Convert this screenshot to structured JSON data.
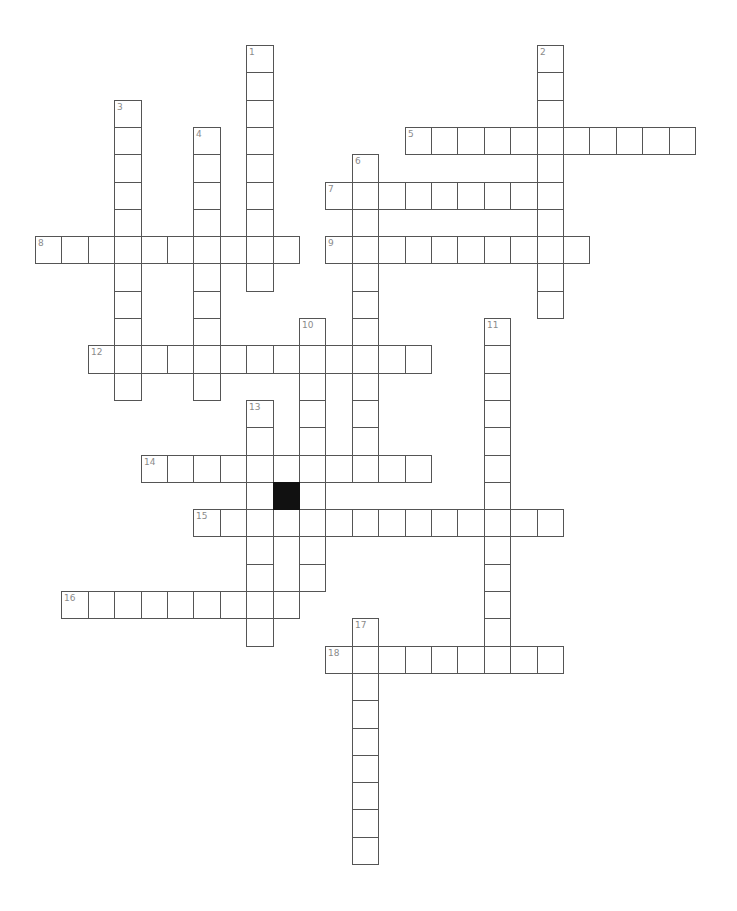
{
  "puzzle": {
    "type": "crossword",
    "grid": {
      "origin_x": 35,
      "origin_y": 45,
      "cell_width": 26.4,
      "cell_height": 27.3,
      "line_color": "#555555",
      "number_color": "#8a8a8a",
      "black_color": "#111111"
    },
    "across": [
      {
        "number": "5",
        "row": 3,
        "col": 14,
        "length": 11
      },
      {
        "number": "7",
        "row": 5,
        "col": 11,
        "length": 9
      },
      {
        "number": "8",
        "row": 7,
        "col": 0,
        "length": 10
      },
      {
        "number": "9",
        "row": 7,
        "col": 11,
        "length": 10
      },
      {
        "number": "12",
        "row": 11,
        "col": 2,
        "length": 13
      },
      {
        "number": "14",
        "row": 15,
        "col": 4,
        "length": 11
      },
      {
        "number": "15",
        "row": 17,
        "col": 6,
        "length": 14
      },
      {
        "number": "16",
        "row": 20,
        "col": 1,
        "length": 9
      },
      {
        "number": "18",
        "row": 22,
        "col": 11,
        "length": 9
      }
    ],
    "down": [
      {
        "number": "1",
        "row": 0,
        "col": 8,
        "length": 9
      },
      {
        "number": "2",
        "row": 0,
        "col": 19,
        "length": 10
      },
      {
        "number": "3",
        "row": 2,
        "col": 3,
        "length": 11
      },
      {
        "number": "4",
        "row": 3,
        "col": 6,
        "length": 10
      },
      {
        "number": "6",
        "row": 4,
        "col": 12,
        "length": 12
      },
      {
        "number": "10",
        "row": 10,
        "col": 10,
        "length": 10
      },
      {
        "number": "11",
        "row": 10,
        "col": 17,
        "length": 13
      },
      {
        "number": "13",
        "row": 13,
        "col": 8,
        "length": 9
      },
      {
        "number": "17",
        "row": 21,
        "col": 12,
        "length": 9
      }
    ],
    "black_cells": [
      {
        "row": 16,
        "col": 9
      }
    ]
  }
}
